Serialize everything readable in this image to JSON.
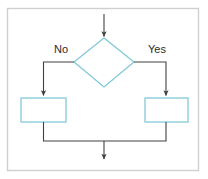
{
  "diagram": {
    "type": "flowchart",
    "title": "",
    "frame": {
      "border_color": "#cfcfcf",
      "background": "#ffffff",
      "x": 7,
      "y": 8,
      "width": 192,
      "height": 163
    },
    "colors": {
      "shape_stroke": "#7ec8d8",
      "shape_fill": "#ffffff",
      "connector_stroke": "#404040",
      "label_text": "#2b2b2b"
    },
    "nodes": [
      {
        "id": "decision",
        "shape": "diamond",
        "label": "",
        "cx": 104,
        "cy": 62,
        "half_width": 30,
        "half_height": 25
      },
      {
        "id": "branch-false-action",
        "shape": "rectangle",
        "label": "",
        "x": 21,
        "y": 98,
        "width": 45,
        "height": 24
      },
      {
        "id": "branch-true-action",
        "shape": "rectangle",
        "label": "",
        "x": 145,
        "y": 98,
        "width": 43,
        "height": 24
      }
    ],
    "edge_labels": [
      {
        "id": "label-no",
        "text": "No",
        "x": 61,
        "y": 53
      },
      {
        "id": "label-yes",
        "text": "Yes",
        "x": 157,
        "y": 53
      }
    ],
    "connectors": [
      {
        "id": "entry-arrow",
        "from": "top",
        "to": "decision",
        "arrow": true
      },
      {
        "id": "no-branch",
        "from": "decision-left",
        "to": "branch-false-action",
        "arrow": true
      },
      {
        "id": "yes-branch",
        "from": "decision-right",
        "to": "branch-true-action",
        "arrow": true
      },
      {
        "id": "merge-left",
        "from": "branch-false-action",
        "to": "merge-point",
        "arrow": false
      },
      {
        "id": "merge-right",
        "from": "branch-true-action",
        "to": "merge-point",
        "arrow": false
      },
      {
        "id": "exit-arrow",
        "from": "merge-point",
        "to": "bottom",
        "arrow": true
      }
    ]
  }
}
